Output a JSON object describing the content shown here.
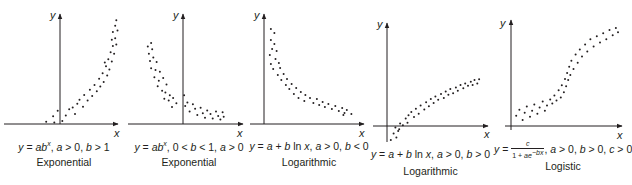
{
  "figure": {
    "panels": [
      {
        "id": "exp-growth",
        "equation_text": "y = ab^x, a > 0, b > 1",
        "model_label": "Exponential",
        "x_axis_label": "x",
        "y_axis_label": "y"
      },
      {
        "id": "exp-decay",
        "equation_text": "y = ab^x, 0 < b < 1, a > 0",
        "model_label": "Exponential",
        "x_axis_label": "x",
        "y_axis_label": "y"
      },
      {
        "id": "log-decreasing",
        "equation_text": "y = a + b ln x, a > 0, b < 0",
        "model_label": "Logarithmic",
        "x_axis_label": "x",
        "y_axis_label": "y"
      },
      {
        "id": "log-increasing",
        "equation_text": "y = a + b ln x, a > 0, b > 0",
        "model_label": "Logarithmic",
        "x_axis_label": "x",
        "y_axis_label": "y"
      },
      {
        "id": "logistic",
        "equation_text": "y = c / (1 + ae^(-bx)), a > 0, b > 0, c > 0",
        "equation_num": "c",
        "equation_den": "1 + ae^(−bx)",
        "equation_conditions": ", a > 0, b > 0, c > 0",
        "model_label": "Logistic",
        "x_axis_label": "x",
        "y_axis_label": "y"
      }
    ]
  },
  "chart_data": [
    {
      "type": "scatter",
      "title": "Exponential",
      "subtitle": "y = ab^x, a > 0, b > 1",
      "xlabel": "x",
      "ylabel": "y",
      "grid": false,
      "description": "Increasing, concave-up scatter (exponential growth)",
      "points": [
        [
          -1.2,
          0.3
        ],
        [
          -0.5,
          0.2
        ],
        [
          -0.6,
          1.0
        ],
        [
          -0.2,
          1.7
        ],
        [
          0.2,
          0.4
        ],
        [
          0.5,
          1.1
        ],
        [
          0.8,
          1.9
        ],
        [
          1.1,
          2.1
        ],
        [
          1.3,
          1.3
        ],
        [
          1.5,
          2.6
        ],
        [
          1.7,
          3.1
        ],
        [
          2.0,
          2.2
        ],
        [
          2.1,
          3.7
        ],
        [
          2.4,
          3.0
        ],
        [
          2.6,
          4.4
        ],
        [
          2.8,
          3.6
        ],
        [
          3.0,
          5.0
        ],
        [
          3.2,
          4.2
        ],
        [
          3.4,
          5.8
        ],
        [
          3.5,
          4.8
        ],
        [
          3.7,
          6.5
        ],
        [
          3.8,
          5.4
        ],
        [
          4.0,
          7.4
        ],
        [
          4.1,
          6.2
        ],
        [
          4.2,
          8.3
        ],
        [
          4.3,
          7.0
        ],
        [
          4.4,
          9.2
        ],
        [
          4.5,
          8.0
        ],
        [
          4.6,
          10.0
        ],
        [
          4.7,
          9.0
        ],
        [
          4.8,
          11.0
        ],
        [
          4.9,
          10.2
        ],
        [
          4.6,
          11.8
        ],
        [
          4.8,
          12.6
        ],
        [
          4.9,
          13.3
        ],
        [
          5.0,
          12.0
        ],
        [
          4.5,
          10.8
        ],
        [
          3.9,
          7.9
        ]
      ]
    },
    {
      "type": "scatter",
      "title": "Exponential",
      "subtitle": "y = ab^x, 0 < b < 1, a > 0",
      "xlabel": "x",
      "ylabel": "y",
      "grid": false,
      "description": "Decreasing, concave-up scatter (exponential decay)",
      "points": [
        [
          -3.2,
          8.6
        ],
        [
          -2.9,
          9.0
        ],
        [
          -3.1,
          7.8
        ],
        [
          -2.8,
          8.3
        ],
        [
          -3.0,
          7.0
        ],
        [
          -2.7,
          7.4
        ],
        [
          -2.4,
          6.9
        ],
        [
          -2.9,
          6.2
        ],
        [
          -2.5,
          6.0
        ],
        [
          -2.1,
          5.8
        ],
        [
          -2.6,
          5.2
        ],
        [
          -2.2,
          4.8
        ],
        [
          -1.8,
          5.1
        ],
        [
          -2.3,
          4.2
        ],
        [
          -1.9,
          3.7
        ],
        [
          -1.5,
          4.4
        ],
        [
          -1.6,
          3.5
        ],
        [
          -1.2,
          3.2
        ],
        [
          -1.7,
          2.8
        ],
        [
          -1.3,
          2.6
        ],
        [
          -0.9,
          2.9
        ],
        [
          -1.0,
          1.9
        ],
        [
          -0.6,
          2.3
        ],
        [
          0.1,
          3.2
        ],
        [
          0.2,
          2.0
        ],
        [
          0.4,
          2.4
        ],
        [
          0.6,
          1.4
        ],
        [
          0.9,
          2.2
        ],
        [
          1.1,
          1.7
        ],
        [
          1.3,
          1.0
        ],
        [
          1.6,
          1.8
        ],
        [
          1.8,
          1.2
        ],
        [
          2.0,
          0.7
        ],
        [
          2.2,
          1.5
        ],
        [
          2.5,
          1.1
        ],
        [
          2.7,
          0.6
        ],
        [
          3.0,
          1.4
        ],
        [
          3.2,
          0.9
        ],
        [
          3.4,
          0.5
        ],
        [
          3.6,
          1.3
        ],
        [
          3.7,
          0.8
        ]
      ]
    },
    {
      "type": "scatter",
      "title": "Logarithmic",
      "subtitle": "y = a + b ln x, a > 0, b < 0",
      "xlabel": "x",
      "ylabel": "y",
      "grid": false,
      "description": "Decreasing, concave-up scatter (logarithmic with b < 0)",
      "points": [
        [
          0.6,
          9.5
        ],
        [
          0.9,
          9.1
        ],
        [
          0.6,
          8.4
        ],
        [
          0.9,
          8.0
        ],
        [
          0.7,
          7.5
        ],
        [
          1.1,
          7.3
        ],
        [
          0.5,
          6.9
        ],
        [
          1.0,
          6.5
        ],
        [
          1.3,
          6.1
        ],
        [
          0.6,
          6.0
        ],
        [
          0.8,
          5.5
        ],
        [
          1.4,
          5.6
        ],
        [
          1.2,
          4.9
        ],
        [
          1.7,
          5.0
        ],
        [
          1.5,
          4.4
        ],
        [
          2.0,
          4.5
        ],
        [
          1.9,
          3.9
        ],
        [
          2.4,
          4.0
        ],
        [
          2.2,
          3.5
        ],
        [
          2.8,
          3.6
        ],
        [
          2.6,
          3.0
        ],
        [
          3.2,
          3.2
        ],
        [
          3.0,
          2.6
        ],
        [
          3.6,
          2.9
        ],
        [
          3.5,
          2.3
        ],
        [
          4.0,
          2.6
        ],
        [
          4.3,
          2.1
        ],
        [
          4.6,
          2.5
        ],
        [
          4.8,
          1.9
        ],
        [
          5.1,
          2.2
        ],
        [
          5.3,
          1.7
        ],
        [
          5.6,
          2.0
        ],
        [
          5.9,
          1.5
        ],
        [
          6.2,
          1.8
        ],
        [
          6.5,
          1.3
        ],
        [
          6.8,
          1.6
        ],
        [
          7.0,
          1.1
        ],
        [
          7.2,
          1.4
        ],
        [
          6.9,
          0.9
        ],
        [
          7.6,
          1.0
        ]
      ]
    },
    {
      "type": "scatter",
      "title": "Logarithmic",
      "subtitle": "y = a + b ln x, a > 0, b > 0",
      "xlabel": "x",
      "ylabel": "y",
      "grid": false,
      "description": "Increasing, concave-down scatter (logarithmic with b > 0)",
      "points": [
        [
          0.3,
          -1.7
        ],
        [
          0.6,
          -0.9
        ],
        [
          0.9,
          -1.4
        ],
        [
          1.1,
          -0.6
        ],
        [
          0.8,
          -0.2
        ],
        [
          1.3,
          0.3
        ],
        [
          1.6,
          0.1
        ],
        [
          1.2,
          -0.4
        ],
        [
          1.9,
          0.9
        ],
        [
          2.2,
          1.3
        ],
        [
          2.1,
          0.4
        ],
        [
          2.5,
          1.7
        ],
        [
          2.8,
          1.1
        ],
        [
          3.0,
          2.1
        ],
        [
          3.3,
          1.5
        ],
        [
          3.5,
          2.5
        ],
        [
          3.9,
          2.0
        ],
        [
          4.1,
          2.9
        ],
        [
          4.4,
          2.4
        ],
        [
          4.6,
          3.3
        ],
        [
          4.9,
          2.8
        ],
        [
          5.1,
          3.6
        ],
        [
          5.4,
          3.2
        ],
        [
          5.7,
          3.9
        ],
        [
          6.0,
          3.4
        ],
        [
          6.2,
          4.2
        ],
        [
          6.5,
          3.8
        ],
        [
          6.7,
          4.5
        ],
        [
          7.0,
          4.0
        ],
        [
          7.3,
          4.7
        ],
        [
          7.5,
          4.3
        ],
        [
          7.8,
          5.0
        ],
        [
          8.1,
          4.6
        ],
        [
          8.3,
          5.2
        ],
        [
          8.6,
          4.9
        ],
        [
          8.9,
          5.4
        ],
        [
          9.1,
          5.0
        ],
        [
          9.3,
          5.6
        ],
        [
          9.6,
          5.2
        ],
        [
          9.8,
          5.7
        ]
      ]
    },
    {
      "type": "scatter",
      "title": "Logistic",
      "subtitle": "y = c / (1 + ae^(-bx)), a > 0, b > 0, c > 0",
      "xlabel": "x",
      "ylabel": "y",
      "grid": false,
      "description": "S-shaped (sigmoid) scatter leveling off at top (logistic growth)",
      "points": [
        [
          0.4,
          1.0
        ],
        [
          0.7,
          1.6
        ],
        [
          1.0,
          0.6
        ],
        [
          1.2,
          1.3
        ],
        [
          1.4,
          1.9
        ],
        [
          1.7,
          0.9
        ],
        [
          1.9,
          1.5
        ],
        [
          2.1,
          2.1
        ],
        [
          2.4,
          1.2
        ],
        [
          2.6,
          1.8
        ],
        [
          2.9,
          2.4
        ],
        [
          3.1,
          1.5
        ],
        [
          3.3,
          2.0
        ],
        [
          3.6,
          2.6
        ],
        [
          3.8,
          2.2
        ],
        [
          4.0,
          3.0
        ],
        [
          4.2,
          2.5
        ],
        [
          4.4,
          3.5
        ],
        [
          4.6,
          2.8
        ],
        [
          4.7,
          4.0
        ],
        [
          4.9,
          3.3
        ],
        [
          5.0,
          4.6
        ],
        [
          5.1,
          3.9
        ],
        [
          5.2,
          5.2
        ],
        [
          5.3,
          4.5
        ],
        [
          5.4,
          5.8
        ],
        [
          5.5,
          5.0
        ],
        [
          5.6,
          6.4
        ],
        [
          5.8,
          5.6
        ],
        [
          6.0,
          7.0
        ],
        [
          6.2,
          6.2
        ],
        [
          6.4,
          7.5
        ],
        [
          6.6,
          6.8
        ],
        [
          6.9,
          8.0
        ],
        [
          7.1,
          7.3
        ],
        [
          7.4,
          8.5
        ],
        [
          7.7,
          7.8
        ],
        [
          8.0,
          8.8
        ],
        [
          8.3,
          8.2
        ],
        [
          8.6,
          9.1
        ],
        [
          8.9,
          8.5
        ],
        [
          9.2,
          9.4
        ],
        [
          9.5,
          8.9
        ],
        [
          9.8,
          9.6
        ],
        [
          10.0,
          9.2
        ]
      ]
    }
  ]
}
